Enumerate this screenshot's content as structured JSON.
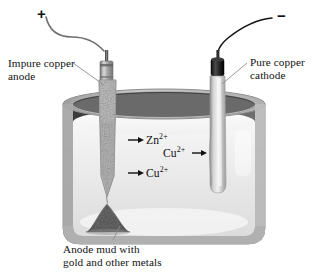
{
  "diagram": {
    "background_color": "#ffffff",
    "labels": {
      "positive_terminal": "+",
      "negative_terminal": "−",
      "anode_label_line1": "Impure copper",
      "anode_label_line2": "anode",
      "cathode_label_line1": "Pure copper",
      "cathode_label_line2": "cathode",
      "caption_line1": "Anode mud with",
      "caption_line2": "gold and other metals"
    },
    "ions": [
      {
        "id": "zn-anode",
        "species": "Zn",
        "charge": "2+",
        "arrow": "left",
        "text": "Zn2+"
      },
      {
        "id": "cu-anode",
        "species": "Cu",
        "charge": "2+",
        "arrow": "left",
        "text": "Cu2+"
      },
      {
        "id": "cu-cathode",
        "species": "Cu",
        "charge": "2+",
        "arrow": "right",
        "text": "Cu2+"
      }
    ],
    "electrodes": [
      {
        "id": "anode",
        "name": "impure-copper-anode",
        "polarity": "+",
        "surface": "rough speckled",
        "wire_color": "#6d6d6d",
        "cap_color": "#9a9a9a"
      },
      {
        "id": "cathode",
        "name": "pure-copper-cathode",
        "polarity": "−",
        "surface": "smooth",
        "wire_color": "#1a1a1a",
        "cap_color": "#262626"
      }
    ],
    "vessel": {
      "name": "electrolytic-cell-tank",
      "wall_color": "#b4b4b4",
      "inner_back_color": "#4f4f4f",
      "electrolyte_color": "#e9e9e9",
      "electrolyte_surface_color": "#fbfbfb"
    },
    "anode_mud": {
      "name": "anode-mud-pile",
      "color": "#5b5b5b"
    },
    "colors": {
      "text": "#111111",
      "leader_line": "#8d8d8d",
      "arrow": "#111111"
    }
  }
}
